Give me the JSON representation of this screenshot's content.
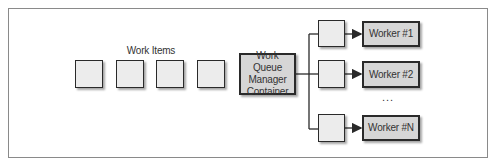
{
  "diagram": {
    "work_items_label": "Work Items",
    "work_items": [
      "",
      "",
      "",
      ""
    ],
    "manager": {
      "label": "Work Queue\nManager\nContainer"
    },
    "queues": [
      "",
      "",
      ""
    ],
    "workers": [
      {
        "label": "Worker #1"
      },
      {
        "label": "Worker #2"
      },
      {
        "label": "Worker #N"
      }
    ],
    "ellipsis": "..."
  },
  "colors": {
    "box_fill": "#ececec",
    "dark_box_fill": "#d6d6d6",
    "stroke": "#2a2a2a",
    "frame": "#8a8a8a"
  }
}
